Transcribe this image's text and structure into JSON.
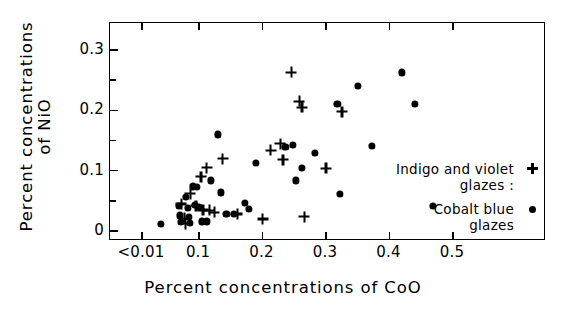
{
  "chart_data": {
    "type": "scatter",
    "title": "",
    "xlabel": "Percent concentrations of CoO",
    "ylabel_line1": "Percent concentrations",
    "ylabel_line2": "of NiO",
    "xlim": [
      0.0,
      0.545
    ],
    "ylim": [
      0.0,
      0.36
    ],
    "xticks": [
      0.01,
      0.1,
      0.2,
      0.3,
      0.4,
      0.5
    ],
    "xticklabels": [
      "<0.01",
      "0.1",
      "0.2",
      "0.3",
      "0.4",
      "0.5"
    ],
    "yticks": [
      0,
      0.1,
      0.2,
      0.3
    ],
    "yticklabels": [
      "0",
      "0.1",
      "0.2",
      "0.3"
    ],
    "yminorticks": [
      0.05,
      0.15,
      0.25,
      0.35
    ],
    "grid": false,
    "legend_position": "lower-right inside",
    "series": [
      {
        "name": "Indigo and violet glazes",
        "marker": "plus",
        "color": "#000000",
        "points": [
          [
            0.072,
            0.045
          ],
          [
            0.077,
            0.021
          ],
          [
            0.079,
            0.012
          ],
          [
            0.086,
            0.062
          ],
          [
            0.095,
            0.042
          ],
          [
            0.103,
            0.09
          ],
          [
            0.106,
            0.035
          ],
          [
            0.112,
            0.105
          ],
          [
            0.116,
            0.034
          ],
          [
            0.124,
            0.031
          ],
          [
            0.137,
            0.12
          ],
          [
            0.16,
            0.028
          ],
          [
            0.2,
            0.02
          ],
          [
            0.213,
            0.134
          ],
          [
            0.228,
            0.145
          ],
          [
            0.232,
            0.118
          ],
          [
            0.245,
            0.263
          ],
          [
            0.258,
            0.215
          ],
          [
            0.262,
            0.205
          ],
          [
            0.266,
            0.024
          ],
          [
            0.3,
            0.104
          ],
          [
            0.325,
            0.198
          ]
        ]
      },
      {
        "name": "Cobalt blue glazes",
        "marker": "dot",
        "color": "#000000",
        "points": [
          [
            0.04,
            0.012
          ],
          [
            0.068,
            0.042
          ],
          [
            0.07,
            0.026
          ],
          [
            0.071,
            0.015
          ],
          [
            0.079,
            0.056
          ],
          [
            0.082,
            0.038
          ],
          [
            0.084,
            0.023
          ],
          [
            0.086,
            0.014
          ],
          [
            0.09,
            0.074
          ],
          [
            0.093,
            0.043
          ],
          [
            0.096,
            0.073
          ],
          [
            0.1,
            0.04
          ],
          [
            0.104,
            0.016
          ],
          [
            0.112,
            0.016
          ],
          [
            0.118,
            0.084
          ],
          [
            0.129,
            0.16
          ],
          [
            0.134,
            0.064
          ],
          [
            0.143,
            0.028
          ],
          [
            0.155,
            0.028
          ],
          [
            0.172,
            0.046
          ],
          [
            0.178,
            0.036
          ],
          [
            0.19,
            0.113
          ],
          [
            0.236,
            0.14
          ],
          [
            0.248,
            0.143
          ],
          [
            0.252,
            0.084
          ],
          [
            0.262,
            0.104
          ],
          [
            0.282,
            0.13
          ],
          [
            0.318,
            0.21
          ],
          [
            0.322,
            0.062
          ],
          [
            0.35,
            0.24
          ],
          [
            0.372,
            0.141
          ],
          [
            0.42,
            0.263
          ],
          [
            0.44,
            0.21
          ],
          [
            0.468,
            0.042
          ]
        ]
      }
    ]
  },
  "legend": {
    "entries": [
      {
        "line1": "Indigo and violet",
        "line2": "glazes :",
        "marker": "plus"
      },
      {
        "line1": "Cobalt blue",
        "line2": "glazes",
        "marker": "dot"
      }
    ]
  }
}
